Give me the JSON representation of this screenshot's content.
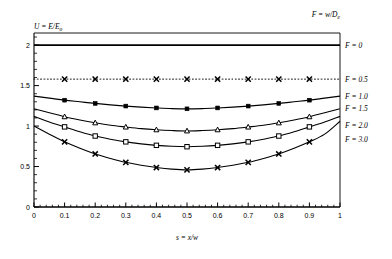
{
  "figure": {
    "header_note": "F = w/D",
    "header_note_sub": "e",
    "ylabel_main": "U  =  E/E",
    "ylabel_sub": "o",
    "xlabel_main": "s  =  x/w",
    "background": "#ffffff",
    "line_color": "#000000"
  },
  "chart_data": {
    "type": "line",
    "title": "",
    "subtitle": "",
    "xlabel": "s = x/w",
    "ylabel": "U = E/E_o",
    "xlim": [
      0,
      1
    ],
    "ylim": [
      0,
      2.15
    ],
    "grid": false,
    "legend_position": "right-outside",
    "legend_title": "F = w/D_e",
    "xticks": [
      0,
      0.1,
      0.2,
      0.3,
      0.4,
      0.5,
      0.6,
      0.7,
      0.8,
      0.9,
      1
    ],
    "xticklabels": [
      "0",
      "0.1",
      "0.2",
      "0.3",
      "0.4",
      "0.5",
      "0.6",
      "0.7",
      "0.8",
      "0.9",
      "1"
    ],
    "yticks": [
      0,
      0.5,
      1,
      1.5,
      2
    ],
    "yticklabels": [
      "0",
      "0.5",
      "1",
      "1.5",
      "2"
    ],
    "x": [
      0,
      0.05,
      0.1,
      0.15,
      0.2,
      0.25,
      0.3,
      0.35,
      0.4,
      0.45,
      0.5,
      0.55,
      0.6,
      0.65,
      0.7,
      0.75,
      0.8,
      0.85,
      0.9,
      0.95,
      1
    ],
    "marker_x": [
      0.1,
      0.2,
      0.3,
      0.4,
      0.5,
      0.6,
      0.7,
      0.8,
      0.9
    ],
    "series": [
      {
        "name": "F = 0",
        "label": "F = 0",
        "F": 0,
        "style": "solid",
        "marker": "none",
        "values": [
          2.0,
          2.0,
          2.0,
          2.0,
          2.0,
          2.0,
          2.0,
          2.0,
          2.0,
          2.0,
          2.0,
          2.0,
          2.0,
          2.0,
          2.0,
          2.0,
          2.0,
          2.0,
          2.0,
          2.0,
          2.0
        ]
      },
      {
        "name": "F = 0.5",
        "label": "F = 0.5",
        "F": 0.5,
        "style": "dotted",
        "marker": "cross",
        "values": [
          1.58,
          1.58,
          1.58,
          1.58,
          1.58,
          1.58,
          1.58,
          1.58,
          1.58,
          1.58,
          1.58,
          1.58,
          1.58,
          1.58,
          1.58,
          1.58,
          1.58,
          1.58,
          1.58,
          1.58,
          1.58
        ]
      },
      {
        "name": "F = 1.0",
        "label": "F = 1.0",
        "F": 1.0,
        "style": "solid",
        "marker": "filled-square",
        "values": [
          1.37,
          1.345,
          1.32,
          1.3,
          1.28,
          1.262,
          1.247,
          1.234,
          1.224,
          1.216,
          1.213,
          1.216,
          1.224,
          1.234,
          1.247,
          1.262,
          1.28,
          1.3,
          1.32,
          1.345,
          1.37
        ]
      },
      {
        "name": "F = 1.5",
        "label": "F = 1.5",
        "F": 1.5,
        "style": "solid",
        "marker": "triangle",
        "values": [
          1.215,
          1.165,
          1.115,
          1.075,
          1.04,
          1.01,
          0.988,
          0.968,
          0.954,
          0.945,
          0.94,
          0.945,
          0.954,
          0.968,
          0.988,
          1.01,
          1.04,
          1.075,
          1.115,
          1.165,
          1.215
        ]
      },
      {
        "name": "F = 2.0",
        "label": "F = 2.0",
        "F": 2.0,
        "style": "solid",
        "marker": "open-square",
        "values": [
          1.12,
          1.05,
          0.99,
          0.93,
          0.877,
          0.838,
          0.805,
          0.78,
          0.762,
          0.75,
          0.745,
          0.75,
          0.762,
          0.78,
          0.805,
          0.838,
          0.877,
          0.93,
          0.99,
          1.05,
          1.12
        ]
      },
      {
        "name": "F = 3.0",
        "label": "F = 3.0",
        "F": 3.0,
        "style": "solid",
        "marker": "cross",
        "values": [
          1.0,
          0.9,
          0.805,
          0.725,
          0.655,
          0.6,
          0.552,
          0.515,
          0.488,
          0.468,
          0.458,
          0.468,
          0.488,
          0.515,
          0.552,
          0.6,
          0.655,
          0.725,
          0.805,
          0.9,
          1.06
        ]
      }
    ]
  }
}
